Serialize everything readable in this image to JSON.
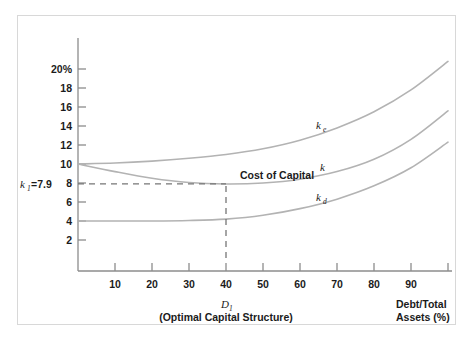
{
  "chart_data": {
    "type": "line",
    "title": "",
    "xlabel": "Debt/Total Assets (%)",
    "ylabel": "",
    "xlim": [
      0,
      100
    ],
    "ylim": [
      0,
      21
    ],
    "grid": false,
    "legend_position": "inline-curve-labels",
    "x_ticks": [
      10,
      20,
      30,
      40,
      50,
      60,
      70,
      80,
      90
    ],
    "x_tick_labels": [
      "10",
      "20",
      "30",
      "40",
      "50",
      "60",
      "70",
      "80",
      "90"
    ],
    "y_ticks": [
      2,
      4,
      6,
      8,
      10,
      12,
      14,
      16,
      18,
      20
    ],
    "y_tick_labels": [
      "2",
      "4",
      "6",
      "8",
      "10",
      "12",
      "14",
      "16",
      "18",
      "20%"
    ],
    "x": [
      0,
      10,
      20,
      30,
      40,
      50,
      60,
      70,
      80,
      90,
      100
    ],
    "series": [
      {
        "name": "ke",
        "label": "k",
        "label_sub": "e",
        "values": [
          10.0,
          10.1,
          10.3,
          10.6,
          11.0,
          11.6,
          12.5,
          13.8,
          15.5,
          17.8,
          20.8
        ]
      },
      {
        "name": "k",
        "label": "k",
        "label_sub": "",
        "values": [
          10.0,
          9.2,
          8.5,
          8.05,
          7.9,
          8.0,
          8.4,
          9.2,
          10.5,
          12.6,
          15.6
        ]
      },
      {
        "name": "kd",
        "label": "k",
        "label_sub": "d",
        "values": [
          4.0,
          4.0,
          4.0,
          4.05,
          4.2,
          4.6,
          5.3,
          6.3,
          7.7,
          9.6,
          12.3
        ]
      }
    ],
    "annotations": [
      {
        "name": "cost-of-capital",
        "text": "Cost of Capital",
        "x": 43,
        "y": 9.0
      },
      {
        "name": "k1-value",
        "text": "k",
        "text_sub": "1",
        "text_tail": "=7.9",
        "x": -14,
        "y": 8
      },
      {
        "name": "optimal-structure-marker",
        "text": "D",
        "text_sub": "1",
        "caption": "(Optimal Capital Structure)",
        "x": 40
      }
    ],
    "guides": [
      {
        "name": "horizontal-dashed-line",
        "orientation": "horizontal",
        "value": 7.9,
        "from": 0,
        "to": 40
      },
      {
        "name": "vertical-dashed-line",
        "orientation": "vertical",
        "value": 40,
        "from": 0,
        "to": 7.9
      }
    ],
    "colors": {
      "curve": "#b3b3b3",
      "axis": "#8c8c8c",
      "text": "#1b1b1b",
      "guide": "#767676",
      "frame": "#d8d8d8",
      "background": "#ffffff"
    }
  },
  "axis_labels": {
    "x_right_line1": "Debt/Total",
    "x_right_line2": "Assets (%)",
    "x_center_main": "D",
    "x_center_sub": "1",
    "x_center_caption": "(Optimal Capital Structure)"
  }
}
